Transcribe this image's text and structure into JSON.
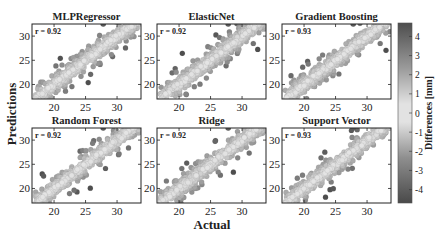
{
  "figure": {
    "xlabel": "Actual",
    "ylabel": "Predictions",
    "colorbar": {
      "label": "Differences [mm]",
      "ticks": [
        "4",
        "3",
        "2",
        "1",
        "0",
        "-1",
        "-2",
        "-3",
        "-4"
      ],
      "range": [
        -4.7,
        4.7
      ],
      "colors": {
        "low": "#4a4a4a",
        "mid": "#e6e6e6",
        "high": "#555555"
      }
    }
  },
  "chart_data": [
    {
      "type": "scatter",
      "title": "MLPRegressor",
      "annotation": "r = 0.92",
      "xlabel": "Actual",
      "ylabel": "Predictions",
      "xticks": [
        "20",
        "25",
        "30"
      ],
      "yticks": [
        "20",
        "25",
        "30"
      ],
      "xlim": [
        16.5,
        33.8
      ],
      "ylim": [
        17,
        32.5
      ],
      "trend": "points along y = x, colored by Predictions - Actual difference"
    },
    {
      "type": "scatter",
      "title": "ElasticNet",
      "annotation": "r = 0.92",
      "xlabel": "Actual",
      "ylabel": "Predictions",
      "xticks": [
        "20",
        "25",
        "30"
      ],
      "yticks": [
        "20",
        "25",
        "30"
      ],
      "xlim": [
        16.5,
        33.8
      ],
      "ylim": [
        17,
        32.5
      ]
    },
    {
      "type": "scatter",
      "title": "Gradient Boosting",
      "annotation": "r = 0.93",
      "xlabel": "Actual",
      "ylabel": "Predictions",
      "xticks": [
        "20",
        "25",
        "30"
      ],
      "yticks": [
        "20",
        "25",
        "30"
      ],
      "xlim": [
        16.5,
        33.8
      ],
      "ylim": [
        17,
        32.5
      ]
    },
    {
      "type": "scatter",
      "title": "Random Forest",
      "annotation": "r = 0.92",
      "xlabel": "Actual",
      "ylabel": "Predictions",
      "xticks": [
        "20",
        "25",
        "30"
      ],
      "yticks": [
        "20",
        "25",
        "30"
      ],
      "xlim": [
        16.5,
        33.8
      ],
      "ylim": [
        17,
        32.5
      ]
    },
    {
      "type": "scatter",
      "title": "Ridge",
      "annotation": "r = 0.92",
      "xlabel": "Actual",
      "ylabel": "Predictions",
      "xticks": [
        "20",
        "25",
        "30"
      ],
      "yticks": [
        "20",
        "25",
        "30"
      ],
      "xlim": [
        16.5,
        33.8
      ],
      "ylim": [
        17,
        32.5
      ]
    },
    {
      "type": "scatter",
      "title": "Support Vector",
      "annotation": "r = 0.93",
      "xlabel": "Actual",
      "ylabel": "Predictions",
      "xticks": [
        "20",
        "25",
        "30"
      ],
      "yticks": [
        "20",
        "25",
        "30"
      ],
      "xlim": [
        16.5,
        33.8
      ],
      "ylim": [
        17,
        32.5
      ]
    }
  ]
}
